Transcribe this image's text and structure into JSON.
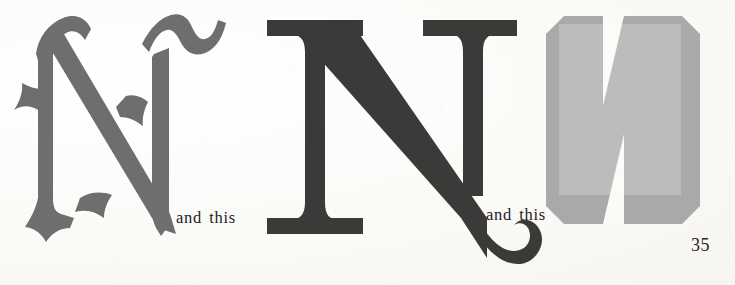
{
  "page": {
    "background_color": "#fbfaf7",
    "page_number": "35"
  },
  "annotations": [
    {
      "id": "annot-1",
      "text": "and this"
    },
    {
      "id": "annot-2",
      "text": "and this"
    }
  ],
  "specimens": [
    {
      "id": "glyph-blackletter",
      "letter": "N",
      "style_name": "blackletter-swash-N",
      "color": "#6e6e6e"
    },
    {
      "id": "glyph-serif",
      "letter": "N",
      "style_name": "serif-swash-tail-N",
      "color": "#3b3a39"
    },
    {
      "id": "glyph-block",
      "letter": "N",
      "style_name": "bold-bevelled-block-N",
      "color": "#a9a9a9",
      "overlay_color": "#bcbcbc"
    }
  ]
}
